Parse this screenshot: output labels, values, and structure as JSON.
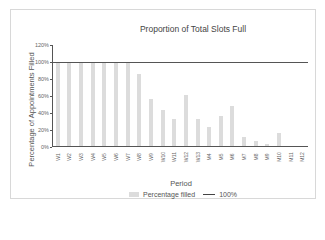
{
  "chart_data": {
    "type": "bar",
    "title": "Proportion of Total Slots Full",
    "xlabel": "Period",
    "ylabel": "Percentage of Appointments Filled",
    "ylim": [
      0,
      120
    ],
    "yticks": [
      "0%",
      "20%",
      "40%",
      "60%",
      "80%",
      "100%",
      "120%"
    ],
    "grid": false,
    "legend_position": "bottom",
    "categories": [
      "W1",
      "W2",
      "W3",
      "W4",
      "W5",
      "W6",
      "W7",
      "W8",
      "W9",
      "W10",
      "W11",
      "W12",
      "W13",
      "M4",
      "M5",
      "M6",
      "M7",
      "M8",
      "M9",
      "M10",
      "M11",
      "M12"
    ],
    "series": [
      {
        "name": "Percentage filled",
        "type": "bar",
        "color": "#dcdcdc",
        "values": [
          99,
          99,
          99,
          99,
          99,
          99,
          99,
          86,
          57,
          43,
          33,
          61,
          33,
          24,
          36,
          48,
          12,
          7,
          3,
          16,
          0,
          0
        ]
      },
      {
        "name": "100%",
        "type": "line",
        "color": "#444444",
        "values": [
          100,
          100,
          100,
          100,
          100,
          100,
          100,
          100,
          100,
          100,
          100,
          100,
          100,
          100,
          100,
          100,
          100,
          100,
          100,
          100,
          100,
          100
        ]
      }
    ]
  },
  "legend": {
    "bar_label": "Percentage filled",
    "line_label": "100%"
  }
}
